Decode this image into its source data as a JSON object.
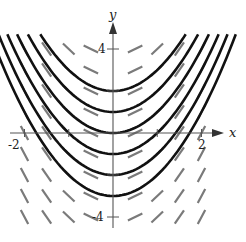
{
  "figure": {
    "x_axis_label": "x",
    "y_axis_label": "y",
    "tick_labels": {
      "x_neg": "-2",
      "x_pos": "2",
      "y_pos": "4",
      "y_neg": "-4"
    },
    "differential_equation": "dy/dx = 2x",
    "solution_family": "y = x^2 + C",
    "solution_constants": [
      2,
      1,
      0,
      -1,
      -2,
      -3
    ],
    "slope_field": {
      "x_values": [
        -2,
        -1.5,
        -1,
        -0.5,
        0.5,
        1,
        1.5,
        2
      ],
      "y_values": [
        4,
        3,
        2,
        1,
        0,
        -1,
        -2,
        -3,
        -4
      ]
    },
    "colors": {
      "curve": "#111111",
      "slope_segment": "#7a7a7a",
      "axis": "#555555"
    },
    "window": {
      "xmin": -2.5,
      "xmax": 2.9,
      "ymin": -5,
      "ymax": 5.5
    }
  }
}
